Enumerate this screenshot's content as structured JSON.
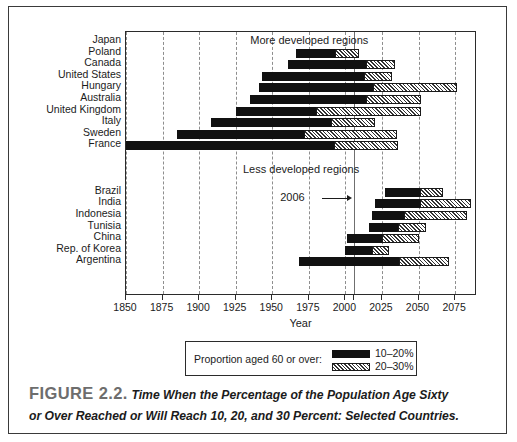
{
  "figure": {
    "number_label": "FIGURE 2.2.",
    "caption_line1": "Time When the Percentage of the Population Age Sixty",
    "caption_line2": "or Over Reached or Will Reach 10, 20, and 30 Percent: Selected Countries."
  },
  "legend": {
    "title": "Proportion aged 60 or over:",
    "entries": [
      {
        "label": "10–20%",
        "style": "solid-black",
        "color": "#111111"
      },
      {
        "label": "20–30%",
        "style": "hatched",
        "color": "#ffffff"
      }
    ]
  },
  "annotations": {
    "more_developed": "More developed regions",
    "less_developed": "Less developed regions",
    "marker_2006": "2006"
  },
  "chart_data": {
    "type": "bar",
    "orientation": "horizontal",
    "subtype": "range-bar",
    "title": "Time When the Percentage of the Population Age Sixty or Over Reached or Will Reach 10, 20, and 30 Percent: Selected Countries",
    "xlabel": "Year",
    "ylabel": "",
    "xlim": [
      1850,
      2090
    ],
    "xticks": [
      1850,
      1875,
      1900,
      1925,
      1950,
      1975,
      2000,
      2025,
      2050,
      2075
    ],
    "xticklabels": [
      "1850",
      "1875",
      "1900",
      "1925",
      "1950",
      "1975",
      "2000",
      "2025",
      "2050",
      "2075"
    ],
    "grid": "vertical-dashed",
    "legend_position": "below-axis",
    "marker_year": 2006,
    "series": [
      {
        "name": "10–20%",
        "style": "solid-black"
      },
      {
        "name": "20–30%",
        "style": "hatched"
      }
    ],
    "groups": [
      {
        "name": "More developed regions",
        "categories": [
          "Japan",
          "Poland",
          "Canada",
          "United States",
          "Hungary",
          "Australia",
          "United Kingdom",
          "Italy",
          "Sweden",
          "France"
        ],
        "bars": [
          {
            "country": "Japan",
            "year_10": null,
            "year_20": null,
            "year_30": null
          },
          {
            "country": "Poland",
            "year_10": 1966,
            "year_20": 1993,
            "year_30": 2009
          },
          {
            "country": "Canada",
            "year_10": 1961,
            "year_20": 2014,
            "year_30": 2034
          },
          {
            "country": "United States",
            "year_10": 1943,
            "year_20": 2013,
            "year_30": 2032
          },
          {
            "country": "Hungary",
            "year_10": 1941,
            "year_20": 2019,
            "year_30": 2076
          },
          {
            "country": "Australia",
            "year_10": 1935,
            "year_20": 2014,
            "year_30": 2052
          },
          {
            "country": "United Kingdom",
            "year_10": 1925,
            "year_20": 1980,
            "year_30": 2052
          },
          {
            "country": "Italy",
            "year_10": 1908,
            "year_20": 1990,
            "year_30": 2020
          },
          {
            "country": "Sweden",
            "year_10": 1885,
            "year_20": 1972,
            "year_30": 2035
          },
          {
            "country": "France",
            "year_10": 1850,
            "year_20": 1992,
            "year_30": 2036
          }
        ]
      },
      {
        "name": "Less developed regions",
        "categories": [
          "Brazil",
          "India",
          "Indonesia",
          "Tunisia",
          "China",
          "Rep. of Korea",
          "Argentina"
        ],
        "bars": [
          {
            "country": "Brazil",
            "year_10": 2027,
            "year_20": 2051,
            "year_30": 2067
          },
          {
            "country": "India",
            "year_10": 2020,
            "year_20": 2051,
            "year_30": 2086
          },
          {
            "country": "Indonesia",
            "year_10": 2018,
            "year_20": 2040,
            "year_30": 2083
          },
          {
            "country": "Tunisia",
            "year_10": 2016,
            "year_20": 2036,
            "year_30": 2055
          },
          {
            "country": "China",
            "year_10": 2001,
            "year_20": 2025,
            "year_30": 2050
          },
          {
            "country": "Rep. of Korea",
            "year_10": 2000,
            "year_20": 2018,
            "year_30": 2030
          },
          {
            "country": "Argentina",
            "year_10": 1968,
            "year_20": 2037,
            "year_30": 2071
          }
        ]
      }
    ]
  },
  "axis": {
    "x_title": "Year"
  }
}
